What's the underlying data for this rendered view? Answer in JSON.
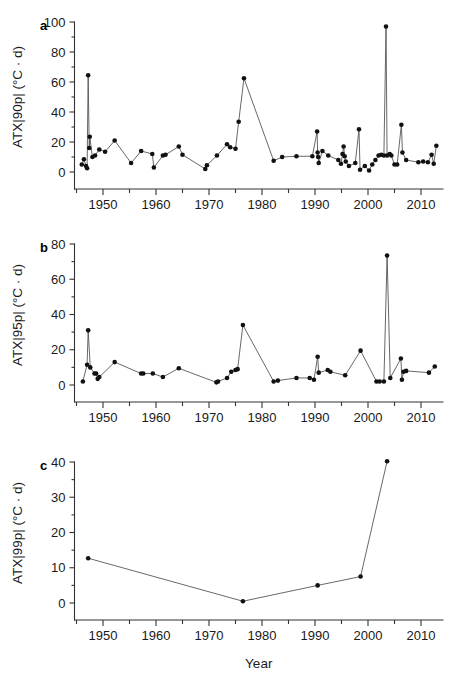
{
  "figure": {
    "xlabel": "Year",
    "panels": [
      "a",
      "b",
      "c"
    ]
  },
  "chart_data": [
    {
      "type": "line",
      "panel_label": "a",
      "title": "",
      "xlabel": "",
      "ylabel": "ATX|90p| (°C · d)",
      "xlim": [
        1945.5,
        2013.5
      ],
      "ylim": [
        0,
        100
      ],
      "yticks": [
        0,
        20,
        40,
        60,
        80,
        100
      ],
      "ytick_labels": [
        "0",
        "20",
        "40",
        "60",
        "80",
        "100"
      ],
      "yminor_step": 10,
      "xticks": [
        1950,
        1960,
        1970,
        1980,
        1990,
        2000,
        2010
      ],
      "xtick_labels": [
        "1950",
        "1960",
        "1970",
        "1980",
        "1990",
        "2000",
        "2010"
      ],
      "xminor_step": 5,
      "grid": false,
      "legend": "none",
      "markers": "filled-circle",
      "x": [
        1946.0,
        1946.4,
        1946.8,
        1947.0,
        1947.2,
        1947.4,
        1947.5,
        1948.0,
        1948.5,
        1949.3,
        1950.4,
        1952.2,
        1955.3,
        1957.2,
        1959.3,
        1959.6,
        1961.3,
        1961.8,
        1964.3,
        1965.0,
        1969.3,
        1969.6,
        1971.5,
        1973.4,
        1974.0,
        1975.0,
        1975.6,
        1976.6,
        1982.2,
        1983.8,
        1986.5,
        1989.5,
        1990.4,
        1990.5,
        1990.6,
        1990.7,
        1991.4,
        1992.5,
        1994.4,
        1994.9,
        1995.2,
        1995.4,
        1995.6,
        1995.8,
        1996.4,
        1997.6,
        1998.3,
        1998.5,
        1999.4,
        2000.2,
        2000.8,
        2001.4,
        2002.0,
        2002.5,
        2003.0,
        2003.4,
        2003.6,
        2004.1,
        2004.4,
        2005.0,
        2005.5,
        2006.3,
        2006.5,
        2007.2,
        2009.5,
        2010.4,
        2011.3,
        2012.0,
        2012.4,
        2012.9
      ],
      "y": [
        5.0,
        8.5,
        4.0,
        2.5,
        64.5,
        16.0,
        23.5,
        10.0,
        11.0,
        15.0,
        13.5,
        21.0,
        6.0,
        14.0,
        12.0,
        3.0,
        11.0,
        11.5,
        17.0,
        11.5,
        2.0,
        4.5,
        11.0,
        18.5,
        16.5,
        15.5,
        33.5,
        62.5,
        7.5,
        10.0,
        10.5,
        10.5,
        27.0,
        13.0,
        10.0,
        6.0,
        14.0,
        11.0,
        8.0,
        5.5,
        12.0,
        17.0,
        10.5,
        7.0,
        4.0,
        6.0,
        28.5,
        1.5,
        4.0,
        1.0,
        5.0,
        8.0,
        11.0,
        11.5,
        11.0,
        97.0,
        11.0,
        12.0,
        11.0,
        5.0,
        5.0,
        31.5,
        13.0,
        8.0,
        6.5,
        7.0,
        6.5,
        11.5,
        5.5,
        17.5
      ]
    },
    {
      "type": "line",
      "panel_label": "b",
      "title": "",
      "xlabel": "",
      "ylabel": "ATX|95p| (°C · d)",
      "xlim": [
        1945.5,
        2013.5
      ],
      "ylim": [
        0,
        80
      ],
      "yticks": [
        0,
        20,
        40,
        60,
        80
      ],
      "ytick_labels": [
        "0",
        "20",
        "40",
        "60",
        "80"
      ],
      "yminor_step": 10,
      "xticks": [
        1950,
        1960,
        1970,
        1980,
        1990,
        2000,
        2010
      ],
      "xtick_labels": [
        "1950",
        "1960",
        "1970",
        "1980",
        "1990",
        "2000",
        "2010"
      ],
      "xminor_step": 5,
      "grid": false,
      "legend": "none",
      "markers": "filled-circle",
      "x": [
        1946.2,
        1947.0,
        1947.2,
        1947.6,
        1948.4,
        1948.7,
        1949.0,
        1949.3,
        1952.2,
        1957.2,
        1957.6,
        1959.4,
        1961.3,
        1964.3,
        1971.4,
        1971.7,
        1973.4,
        1974.2,
        1975.0,
        1975.4,
        1976.4,
        1982.2,
        1983.0,
        1986.5,
        1989.0,
        1989.8,
        1990.5,
        1990.7,
        1992.4,
        1992.9,
        1995.7,
        1998.6,
        2001.6,
        2002.2,
        2003.0,
        2003.6,
        2004.2,
        2006.2,
        2006.4,
        2006.7,
        2007.2,
        2011.5,
        2012.6
      ],
      "y": [
        2.0,
        11.5,
        31.0,
        10.0,
        6.5,
        6.5,
        3.5,
        4.5,
        13.0,
        6.5,
        6.5,
        6.5,
        4.5,
        9.5,
        1.5,
        2.0,
        4.0,
        7.5,
        8.5,
        9.0,
        34.0,
        2.0,
        2.5,
        4.0,
        4.0,
        3.0,
        16.0,
        7.0,
        8.5,
        7.5,
        5.5,
        19.5,
        2.0,
        2.0,
        2.0,
        73.5,
        4.0,
        15.0,
        3.0,
        7.5,
        8.0,
        7.0,
        10.5
      ]
    },
    {
      "type": "line",
      "panel_label": "c",
      "title": "",
      "xlabel": "Year",
      "ylabel": "ATX|99p| (°C · d)",
      "xlim": [
        1945.5,
        2013.5
      ],
      "ylim": [
        0,
        40
      ],
      "yticks": [
        0,
        10,
        20,
        30,
        40
      ],
      "ytick_labels": [
        "0",
        "10",
        "20",
        "30",
        "40"
      ],
      "yminor_step": 5,
      "xticks": [
        1950,
        1960,
        1970,
        1980,
        1990,
        2000,
        2010
      ],
      "xtick_labels": [
        "1950",
        "1960",
        "1970",
        "1980",
        "1990",
        "2000",
        "2010"
      ],
      "xminor_step": 5,
      "grid": false,
      "legend": "none",
      "markers": "filled-circle",
      "x": [
        1947.2,
        1976.4,
        1990.5,
        1998.6,
        2003.6
      ],
      "y": [
        12.7,
        0.5,
        5.0,
        7.5,
        40.2
      ]
    }
  ]
}
